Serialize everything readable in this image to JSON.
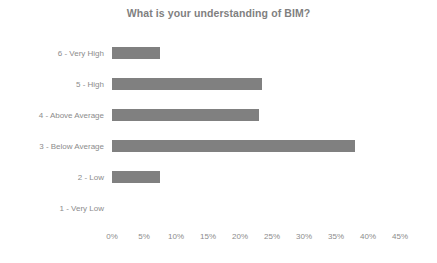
{
  "chart_data": {
    "type": "bar",
    "orientation": "horizontal",
    "title": "What is your understanding of BIM?",
    "xlabel": "",
    "ylabel": "",
    "categories": [
      "6 - Very High",
      "5 - High",
      "4 - Above Average",
      "3 - Below Average",
      "2 - Low",
      "1 - Very Low"
    ],
    "values": [
      7.5,
      23.5,
      23,
      38,
      7.5,
      0
    ],
    "value_unit": "%",
    "xlim": [
      0,
      45
    ],
    "xticks": [
      0,
      5,
      10,
      15,
      20,
      25,
      30,
      35,
      40,
      45
    ],
    "xtick_labels": [
      "0%",
      "5%",
      "10%",
      "15%",
      "20%",
      "25%",
      "30%",
      "35%",
      "40%",
      "45%"
    ],
    "grid": false,
    "legend": false,
    "series": [
      {
        "name": "Responses",
        "values": [
          7.5,
          23.5,
          23,
          38,
          7.5,
          0
        ]
      }
    ],
    "colors": {
      "bar": "#808080",
      "text": "#8c8c8c",
      "title": "#7f7f7f",
      "background": "#ffffff"
    }
  }
}
